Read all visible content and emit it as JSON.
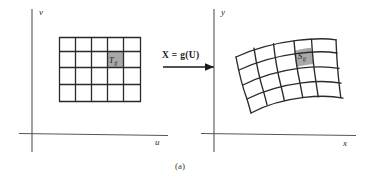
{
  "figure": {
    "caption": "(a)",
    "background_color": "#ffffff",
    "line_color": "#222222",
    "axis_color": "#4a4a4a",
    "shade_color": "#a8a8a8"
  },
  "left_panel": {
    "name": "uv-plane",
    "axis_vertical_label": "v",
    "axis_horizontal_label": "u",
    "grid": {
      "columns": 5,
      "rows": 4,
      "shaded_cell_column": 4,
      "shaded_cell_row": 2,
      "label": "T",
      "label_subscript": "ij"
    }
  },
  "mapping": {
    "name": "transformation-arrow",
    "label": "X = g(U)",
    "arrow_direction": "right"
  },
  "right_panel": {
    "name": "xy-plane",
    "axis_vertical_label": "y",
    "axis_horizontal_label": "x",
    "grid": {
      "columns": 5,
      "rows": 4,
      "shaded_cell_column": 4,
      "shaded_cell_row": 1,
      "label": "S",
      "label_subscript": "ij",
      "shape": "curvilinear"
    }
  }
}
